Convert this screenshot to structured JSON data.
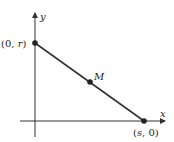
{
  "diagram": {
    "axes": {
      "x_label": "x",
      "y_label": "y",
      "color": "#333333"
    },
    "segment_color": "#333333",
    "point_color": "#222222",
    "points": [
      {
        "id": "y-intercept",
        "label": "(0, r)"
      },
      {
        "id": "midpoint",
        "label": "M"
      },
      {
        "id": "x-intercept",
        "label": "(s, 0)"
      }
    ]
  }
}
